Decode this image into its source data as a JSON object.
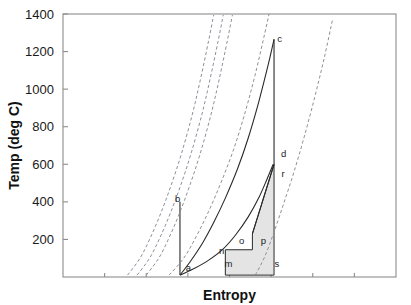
{
  "chart_data": {
    "type": "line",
    "title": "",
    "xlabel": "Entropy",
    "ylabel": "Temp (deg C)",
    "grid": false,
    "legend": null,
    "xlim": [
      0,
      8
    ],
    "ylim": [
      0,
      1400
    ],
    "y_ticks": [
      0,
      200,
      400,
      600,
      800,
      1000,
      1200,
      1400
    ],
    "y_tick_labels": [
      "",
      "200",
      "400",
      "600",
      "800",
      "1000",
      "1200",
      "1400"
    ],
    "x_ticks": [
      0,
      1,
      2,
      3,
      4,
      5,
      6,
      7,
      8
    ],
    "x_tick_labels": [
      "",
      "",
      "",
      "",
      "",
      "",
      "",
      "",
      ""
    ],
    "annotations": [
      {
        "label": "a",
        "x": 2.95,
        "y": 30
      },
      {
        "label": "b",
        "x": 2.69,
        "y": 400
      },
      {
        "label": "c",
        "x": 5.15,
        "y": 1250
      },
      {
        "label": "d",
        "x": 5.24,
        "y": 640
      },
      {
        "label": "r",
        "x": 5.25,
        "y": 530
      },
      {
        "label": "s",
        "x": 5.08,
        "y": 55
      },
      {
        "label": "m",
        "x": 3.88,
        "y": 55
      },
      {
        "label": "n",
        "x": 3.75,
        "y": 120
      },
      {
        "label": "o",
        "x": 4.23,
        "y": 175
      },
      {
        "label": "p",
        "x": 4.75,
        "y": 175
      }
    ],
    "series": [
      {
        "name": "saturation-dome-left",
        "style": "solid",
        "points": [
          [
            2.81,
            10
          ],
          [
            3.05,
            80
          ],
          [
            3.35,
            180
          ],
          [
            3.62,
            290
          ],
          [
            3.9,
            420
          ],
          [
            4.2,
            580
          ],
          [
            4.45,
            740
          ],
          [
            4.7,
            930
          ],
          [
            4.93,
            1130
          ],
          [
            5.07,
            1265
          ]
        ]
      },
      {
        "name": "process-c-to-d-vertical",
        "style": "solid",
        "points": [
          [
            5.07,
            1265
          ],
          [
            5.07,
            600
          ]
        ]
      },
      {
        "name": "process-b-to-a-vertical",
        "style": "solid",
        "points": [
          [
            2.81,
            400
          ],
          [
            2.81,
            10
          ]
        ]
      },
      {
        "name": "lower-expansion-curve",
        "style": "solid",
        "points": [
          [
            2.81,
            10
          ],
          [
            3.15,
            45
          ],
          [
            3.5,
            90
          ],
          [
            3.85,
            150
          ],
          [
            4.15,
            225
          ],
          [
            4.45,
            320
          ],
          [
            4.7,
            420
          ],
          [
            4.9,
            520
          ],
          [
            5.05,
            600
          ]
        ]
      },
      {
        "name": "r-to-p-line",
        "style": "solid",
        "points": [
          [
            5.07,
            600
          ],
          [
            4.55,
            230
          ]
        ]
      },
      {
        "name": "isobar-1",
        "style": "dashed",
        "points": [
          [
            1.55,
            10
          ],
          [
            1.85,
            100
          ],
          [
            2.1,
            210
          ],
          [
            2.35,
            340
          ],
          [
            2.6,
            490
          ],
          [
            2.85,
            660
          ],
          [
            3.1,
            860
          ],
          [
            3.3,
            1050
          ],
          [
            3.5,
            1260
          ],
          [
            3.62,
            1395
          ]
        ]
      },
      {
        "name": "isobar-2",
        "style": "dashed",
        "points": [
          [
            1.78,
            10
          ],
          [
            2.08,
            100
          ],
          [
            2.33,
            210
          ],
          [
            2.58,
            340
          ],
          [
            2.83,
            490
          ],
          [
            3.08,
            660
          ],
          [
            3.33,
            860
          ],
          [
            3.53,
            1050
          ],
          [
            3.73,
            1260
          ],
          [
            3.85,
            1395
          ]
        ]
      },
      {
        "name": "isobar-3",
        "style": "dashed",
        "points": [
          [
            2.0,
            10
          ],
          [
            2.3,
            100
          ],
          [
            2.55,
            210
          ],
          [
            2.8,
            340
          ],
          [
            3.05,
            490
          ],
          [
            3.3,
            660
          ],
          [
            3.55,
            860
          ],
          [
            3.75,
            1050
          ],
          [
            3.95,
            1260
          ],
          [
            4.07,
            1395
          ]
        ]
      },
      {
        "name": "isobar-4",
        "style": "dashed",
        "points": [
          [
            2.55,
            10
          ],
          [
            2.9,
            100
          ],
          [
            3.2,
            215
          ],
          [
            3.5,
            350
          ],
          [
            3.8,
            505
          ],
          [
            4.1,
            680
          ],
          [
            4.38,
            880
          ],
          [
            4.62,
            1080
          ],
          [
            4.85,
            1300
          ],
          [
            4.95,
            1400
          ]
        ]
      },
      {
        "name": "isobar-5",
        "style": "dashed",
        "points": [
          [
            4.62,
            10
          ],
          [
            4.85,
            110
          ],
          [
            5.07,
            240
          ],
          [
            5.3,
            390
          ],
          [
            5.55,
            560
          ],
          [
            5.8,
            750
          ],
          [
            6.05,
            960
          ],
          [
            6.28,
            1170
          ],
          [
            6.48,
            1375
          ]
        ]
      }
    ],
    "shaded_region": {
      "name": "mnoprs-cycle-area",
      "fill": "#e4e4e4",
      "stroke": "#2a2a2a",
      "vertices": [
        [
          3.9,
          10
        ],
        [
          3.9,
          145
        ],
        [
          4.55,
          145
        ],
        [
          4.55,
          230
        ],
        [
          5.07,
          600
        ],
        [
          5.07,
          10
        ]
      ]
    }
  },
  "colors": {
    "axis": "#8c8c8c",
    "curve_solid": "#2a2a2a",
    "curve_dashed": "#8f8f9c",
    "shade_fill": "#e4e4e4",
    "text": "#1a1a1a",
    "background": "#ffffff"
  }
}
